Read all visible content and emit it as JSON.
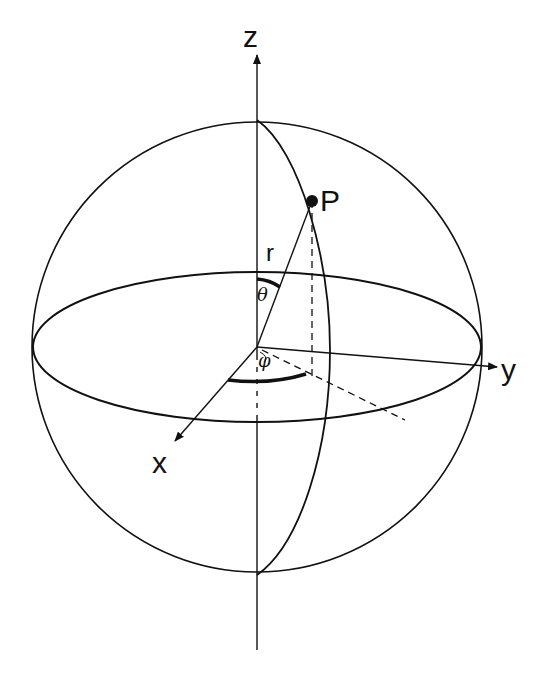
{
  "diagram": {
    "labels": {
      "z_axis": "z",
      "y_axis": "y",
      "x_axis": "x",
      "point": "P",
      "radius": "r",
      "polar_angle": "θ",
      "azimuth_angle": "φ"
    },
    "colors": {
      "stroke": "#111111",
      "background": "#ffffff"
    },
    "geometry": {
      "sphere": {
        "cx": 257,
        "cy": 347,
        "r": 225
      },
      "equator": {
        "cx": 257,
        "cy": 347,
        "rx": 224,
        "ry": 75
      },
      "origin": [
        257,
        347
      ],
      "point_p": [
        312,
        201
      ],
      "projection_foot": [
        312,
        377
      ]
    }
  }
}
